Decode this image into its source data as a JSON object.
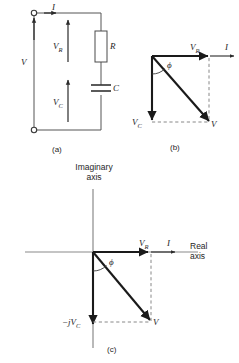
{
  "figure": {
    "kind": "engineering-figure",
    "colors": {
      "ink": "#262626",
      "wire": "#555555",
      "vector": "#1a1a1a",
      "dashed": "#777777",
      "axis": "#8a8a8a",
      "background": "#ffffff"
    }
  },
  "panels": {
    "a": {
      "caption": "(a)",
      "labels": {
        "current": "I",
        "source_voltage": "V",
        "resistor_voltage": "V",
        "resistor_voltage_sub": "R",
        "capacitor_voltage": "V",
        "capacitor_voltage_sub": "C",
        "resistor": "R",
        "capacitor": "C"
      }
    },
    "b": {
      "caption": "(b)",
      "labels": {
        "resistor_voltage": "V",
        "resistor_voltage_sub": "R",
        "current": "I",
        "capacitor_voltage": "V",
        "capacitor_voltage_sub": "C",
        "total_voltage": "V",
        "angle": "ϕ"
      }
    },
    "c": {
      "caption": "(c)",
      "axes": {
        "imaginary_line1": "Imaginary",
        "imaginary_line2": "axis",
        "real_line1": "Real",
        "real_line2": "axis"
      },
      "labels": {
        "resistor_voltage": "V",
        "resistor_voltage_sub": "R",
        "current": "I",
        "capacitor_voltage": "−jV",
        "capacitor_voltage_sub": "C",
        "total_voltage": "V",
        "angle": "ϕ"
      }
    }
  }
}
